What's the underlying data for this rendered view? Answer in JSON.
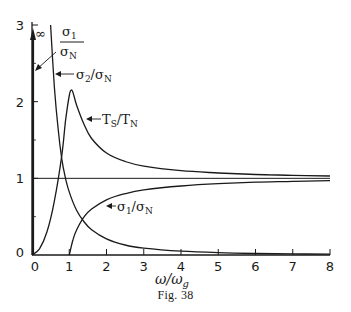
{
  "chart_data": {
    "type": "line",
    "title": "",
    "caption": "Fig. 38",
    "xlabel": "ω/ω_g",
    "xlabel_main": "ω/ω",
    "xlabel_sub": "g",
    "ylabel": "",
    "xlim": [
      0,
      8
    ],
    "ylim": [
      0,
      3
    ],
    "grid": false,
    "x_ticks": [
      0,
      1,
      2,
      3,
      4,
      5,
      6,
      7,
      8
    ],
    "x_tick_labels": [
      "0",
      "1",
      "2",
      "3",
      "4",
      "5",
      "6",
      "7",
      "8"
    ],
    "y_ticks": [
      0,
      1,
      2,
      3
    ],
    "y_tick_labels": [
      "0",
      "1",
      "2",
      "3"
    ],
    "y_minor_ticks": [
      0.5,
      1.5,
      2.5
    ],
    "reference_line": {
      "y": 1
    },
    "series": [
      {
        "name": "σ2/σN",
        "label": "σ₂/σ_N",
        "x": [
          0.5,
          0.6,
          0.7,
          0.8,
          0.9,
          1.0,
          1.2,
          1.4,
          1.6,
          2.0,
          2.5,
          3.0,
          4.0,
          5.0,
          6.0,
          7.0,
          8.0
        ],
        "values": [
          3.0,
          2.2,
          1.65,
          1.25,
          1.0,
          0.82,
          0.58,
          0.43,
          0.33,
          0.21,
          0.13,
          0.09,
          0.05,
          0.03,
          0.02,
          0.015,
          0.01
        ]
      },
      {
        "name": "TS/TN",
        "label": "T_S/T_N",
        "x": [
          0.0,
          0.2,
          0.4,
          0.6,
          0.8,
          0.9,
          1.0,
          1.05,
          1.1,
          1.2,
          1.4,
          1.6,
          2.0,
          2.5,
          3.0,
          4.0,
          5.0,
          6.0,
          7.0,
          8.0
        ],
        "values": [
          0.0,
          0.08,
          0.3,
          0.7,
          1.3,
          1.75,
          2.08,
          2.15,
          2.12,
          1.95,
          1.7,
          1.52,
          1.33,
          1.22,
          1.16,
          1.1,
          1.07,
          1.05,
          1.04,
          1.03
        ]
      },
      {
        "name": "σ1/σN",
        "label": "σ₁/σ_N",
        "note": "∞ at ω/ω_g = 0; zero for 0 < ω/ω_g < 1",
        "x": [
          1.0,
          1.1,
          1.2,
          1.4,
          1.6,
          2.0,
          2.5,
          3.0,
          4.0,
          5.0,
          6.0,
          7.0,
          8.0
        ],
        "values": [
          0.0,
          0.2,
          0.33,
          0.5,
          0.6,
          0.72,
          0.8,
          0.85,
          0.9,
          0.93,
          0.95,
          0.96,
          0.97
        ]
      }
    ],
    "annotations": [
      {
        "text": "σ₁/σ_N",
        "numerator": "σ",
        "numerator_sub": "1",
        "denominator": "σ",
        "denominator_sub": "N",
        "points_to": "vertical line at x=0 (∞)"
      },
      {
        "text": "∞",
        "position": "top of y-axis at x=0"
      },
      {
        "text": "σ₂/σ_N",
        "main_a": "σ",
        "sub_a": "2",
        "main_b": "/σ",
        "sub_b": "N"
      },
      {
        "text": "T_S/T_N",
        "main_a": "T",
        "sub_a": "S",
        "main_b": "/T",
        "sub_b": "N"
      },
      {
        "text": "σ₁/σ_N",
        "main_a": "σ",
        "sub_a": "1",
        "main_b": "/σ",
        "sub_b": "N"
      }
    ]
  }
}
